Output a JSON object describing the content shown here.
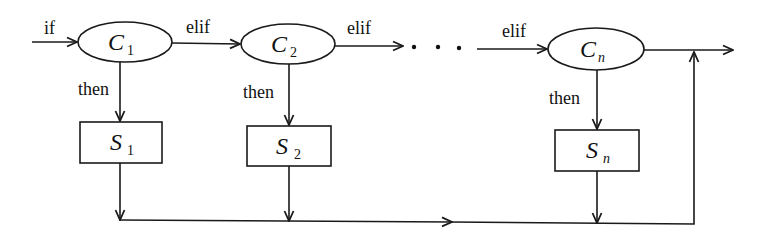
{
  "diagram": {
    "type": "flowchart",
    "entry_label": "if",
    "conditions": [
      {
        "id": "C1",
        "symbol": "C",
        "subscript": "1",
        "branch_in_label": "if",
        "then_label": "then"
      },
      {
        "id": "C2",
        "symbol": "C",
        "subscript": "2",
        "branch_in_label": "elif",
        "then_label": "then"
      },
      {
        "id": "Cn",
        "symbol": "C",
        "subscript": "n",
        "branch_in_label": "elif",
        "then_label": "then"
      }
    ],
    "statements": [
      {
        "id": "S1",
        "symbol": "S",
        "subscript": "1"
      },
      {
        "id": "S2",
        "symbol": "S",
        "subscript": "2"
      },
      {
        "id": "Sn",
        "symbol": "S",
        "subscript": "n"
      }
    ],
    "edge_labels": {
      "if": "if",
      "elif_1": "elif",
      "elif_2": "elif",
      "elif_3": "elif",
      "then_1": "then",
      "then_2": "then",
      "then_n": "then"
    },
    "ellipsis": "· · ·",
    "edges": [
      {
        "from": "start",
        "to": "C1",
        "label": "if"
      },
      {
        "from": "C1",
        "to": "C2",
        "label": "elif"
      },
      {
        "from": "C2",
        "to": "...",
        "label": "elif"
      },
      {
        "from": "...",
        "to": "Cn",
        "label": "elif"
      },
      {
        "from": "C1",
        "to": "S1",
        "label": "then"
      },
      {
        "from": "C2",
        "to": "S2",
        "label": "then"
      },
      {
        "from": "Cn",
        "to": "S2",
        "label": "then"
      },
      {
        "from": "S1",
        "to": "merge",
        "label": ""
      },
      {
        "from": "S2",
        "to": "merge",
        "label": ""
      },
      {
        "from": "Sn",
        "to": "merge",
        "label": ""
      },
      {
        "from": "Cn",
        "to": "exit",
        "label": ""
      },
      {
        "from": "merge",
        "to": "exit",
        "label": ""
      }
    ]
  }
}
